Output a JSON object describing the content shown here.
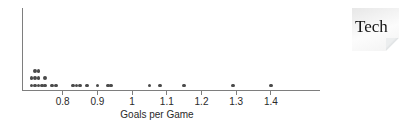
{
  "chart_data": {
    "type": "scatter",
    "subtype": "dot-plot",
    "title": "",
    "xlabel": "Goals per Game",
    "ylabel": "",
    "grid": false,
    "legend": false,
    "xlim": [
      0.685,
      1.54
    ],
    "x_ticks": [
      {
        "label": "0.8",
        "value": 0.8
      },
      {
        "label": "0.9",
        "value": 0.9
      },
      {
        "label": "1",
        "value": 1.0
      },
      {
        "label": "1.1",
        "value": 1.1
      },
      {
        "label": "1.2",
        "value": 1.2
      },
      {
        "label": "1.3",
        "value": 1.3
      },
      {
        "label": "1.4",
        "value": 1.4
      }
    ],
    "values": [
      0.71,
      0.71,
      0.72,
      0.72,
      0.72,
      0.73,
      0.73,
      0.73,
      0.74,
      0.75,
      0.75,
      0.77,
      0.78,
      0.83,
      0.84,
      0.85,
      0.87,
      0.9,
      0.93,
      0.94,
      1.05,
      1.08,
      1.15,
      1.29,
      1.4
    ],
    "dot_color": "#4a4a4a",
    "axis_color": "#7e7e7e",
    "text_color": "#2a2a2a"
  },
  "tech_note": {
    "label": "Tech",
    "bg_color": "#f2f2f2",
    "fold_color": "#b6bcbf"
  }
}
